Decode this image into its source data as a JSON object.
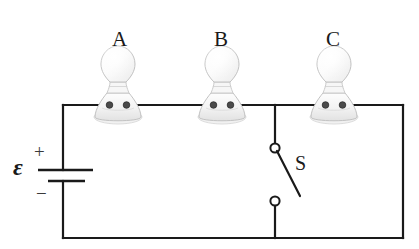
{
  "diagram": {
    "type": "electrical-circuit-schematic",
    "background_color": "#ffffff",
    "wire_color": "#1a1a1a",
    "wire_width_px": 2.2,
    "bulbs": [
      {
        "id": "bulb-a",
        "label": "A",
        "center_x": 118,
        "wire_y": 105,
        "label_x": 112,
        "label_y": 29
      },
      {
        "id": "bulb-b",
        "label": "B",
        "center_x": 222,
        "wire_y": 105,
        "label_x": 214,
        "label_y": 29
      },
      {
        "id": "bulb-c",
        "label": "C",
        "center_x": 334,
        "wire_y": 105,
        "label_x": 326,
        "label_y": 29
      }
    ],
    "battery": {
      "id": "battery",
      "emf_symbol": "ε",
      "plus_sign": "+",
      "minus_sign": "−",
      "emf_x": 13,
      "emf_y": 155,
      "plus_x": 34,
      "plus_y": 142,
      "minus_x": 36,
      "minus_y": 184,
      "long_plate": {
        "x1": 38,
        "x2": 93,
        "y": 170
      },
      "short_plate": {
        "x1": 48,
        "x2": 85,
        "y": 181
      },
      "rail_x": 63
    },
    "switch": {
      "id": "switch",
      "label": "S",
      "state": "open",
      "label_x": 295,
      "label_y": 153,
      "branch_x": 275,
      "top_terminal": {
        "cx": 275,
        "cy": 148,
        "r": 4.6
      },
      "bottom_terminal": {
        "cx": 275,
        "cy": 201,
        "r": 4.6
      },
      "lever": {
        "x1": 277,
        "y1": 151,
        "x2": 300,
        "y2": 196
      }
    },
    "frame": {
      "left_x": 63,
      "right_x": 403,
      "top_y": 105,
      "bottom_y": 238
    }
  }
}
